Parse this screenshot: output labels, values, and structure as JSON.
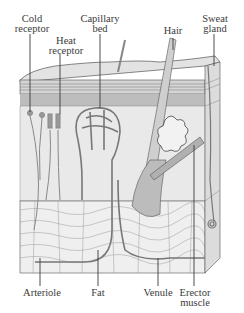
{
  "diagram": {
    "labels": {
      "cold_receptor": "Cold\nreceptor",
      "heat_receptor": "Heat\nreceptor",
      "capillary_bed": "Capillary\nbed",
      "hair": "Hair",
      "sweat_gland": "Sweat\ngland",
      "arteriole": "Arteriole",
      "fat": "Fat",
      "venule": "Venule",
      "erector_muscle": "Erector\nmuscle"
    },
    "colors": {
      "ink": "#3a3a3a",
      "epidermis": "#d9d9d9",
      "dermis": "#e6e6e6",
      "fat_layer": "#ececec",
      "vessel": "#8a8a8a"
    }
  }
}
